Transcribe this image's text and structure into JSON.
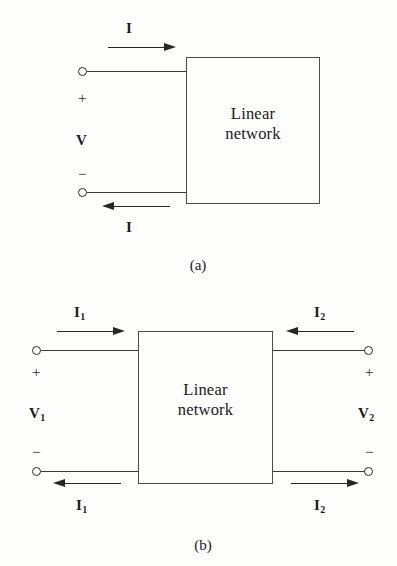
{
  "figure": {
    "background_color": "#fdfdfc",
    "line_color": "#3a3a3a",
    "text_color": "#1c1c1c"
  },
  "panel_a": {
    "caption": "(a)",
    "box_label": "Linear\nnetwork",
    "top_current_label": "I",
    "bottom_current_label": "I",
    "voltage_label": "V",
    "plus_sign": "+",
    "minus_sign": "−",
    "top_arrow_direction": "right",
    "bottom_arrow_direction": "left"
  },
  "panel_b": {
    "caption": "(b)",
    "box_label": "Linear\nnetwork",
    "left_top_current_label": "I",
    "left_top_current_sub": "1",
    "left_bottom_current_label": "I",
    "left_bottom_current_sub": "1",
    "right_top_current_label": "I",
    "right_top_current_sub": "2",
    "right_bottom_current_label": "I",
    "right_bottom_current_sub": "2",
    "left_voltage_label": "V",
    "left_voltage_sub": "1",
    "right_voltage_label": "V",
    "right_voltage_sub": "2",
    "left_plus_sign": "+",
    "left_minus_sign": "−",
    "right_plus_sign": "+",
    "right_minus_sign": "−",
    "left_top_arrow_direction": "right",
    "left_bottom_arrow_direction": "left",
    "right_top_arrow_direction": "left",
    "right_bottom_arrow_direction": "right"
  }
}
